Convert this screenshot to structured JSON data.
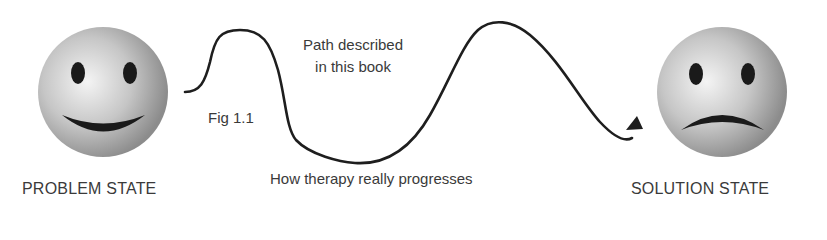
{
  "diagram": {
    "problem_state": {
      "label": "PROBLEM STATE",
      "face": "smiling"
    },
    "solution_state": {
      "label": "SOLUTION STATE",
      "face": "frowning"
    },
    "annotations": {
      "figure": "Fig 1.1",
      "path_line1": "Path described",
      "path_line2": "in this book",
      "progress": "How therapy really progresses"
    },
    "colors": {
      "stroke": "#1e1e1e",
      "text": "#3a3a3a",
      "face_light": "#f2f2f2",
      "face_dark": "#8e8e8e",
      "feature": "#1a1a1a"
    }
  }
}
